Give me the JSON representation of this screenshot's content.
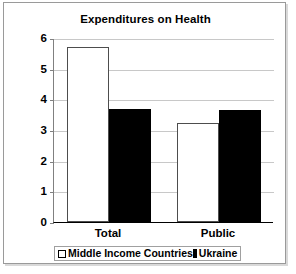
{
  "chart_data": {
    "type": "bar",
    "title": "Expenditures on Health",
    "xlabel": "",
    "ylabel": "",
    "categories": [
      "Total",
      "Public"
    ],
    "series": [
      {
        "name": "Middle Income Countries",
        "values": [
          5.7,
          3.23
        ],
        "color": "#ffffff"
      },
      {
        "name": "Ukraine",
        "values": [
          3.7,
          3.65
        ],
        "color": "#000000"
      }
    ],
    "ylim": [
      0,
      6
    ],
    "yticks": [
      0,
      1,
      2,
      3,
      4,
      5,
      6
    ],
    "ytick_labels": [
      "0",
      "1",
      "2",
      "3",
      "4",
      "5",
      "6"
    ],
    "grid": true,
    "legend_position": "bottom"
  },
  "legend": {
    "entries": [
      {
        "label": "Middle Income Countries",
        "swatch": "white-square-outline"
      },
      {
        "label": "Ukraine",
        "swatch": "black-square"
      }
    ]
  }
}
